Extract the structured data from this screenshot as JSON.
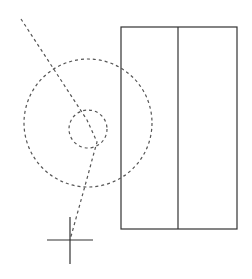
{
  "diagram": {
    "canvas": {
      "width": 252,
      "height": 279,
      "background": "#ffffff"
    },
    "colors": {
      "solid_stroke": "#333333",
      "dashed_stroke": "#555555"
    },
    "rectangle": {
      "x": 121,
      "y": 27,
      "width": 116,
      "height": 202,
      "divider_x": 178
    },
    "large_circle": {
      "cx": 88,
      "cy": 123,
      "r": 64,
      "style": "dashed"
    },
    "small_circle": {
      "cx": 88,
      "cy": 129,
      "r": 19,
      "style": "dashed"
    },
    "dashed_path": {
      "points": "21,19 87,120 97,142 92,160 88,175 70,240"
    },
    "crosshair": {
      "cx": 70,
      "cy": 252,
      "h_half": 23,
      "v_top": 223,
      "v_bottom": 263
    }
  }
}
